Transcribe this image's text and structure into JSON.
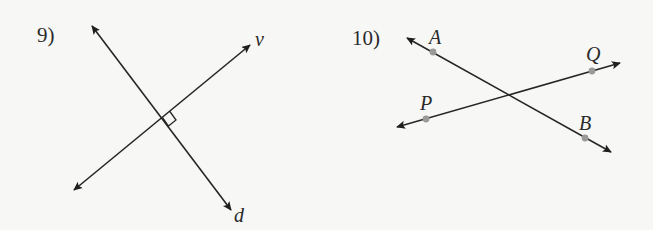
{
  "problems": [
    {
      "number": "9)",
      "lines": [
        {
          "name": "v",
          "label": "v",
          "from": [
            74,
            190
          ],
          "to": [
            250,
            45
          ]
        },
        {
          "name": "d",
          "label": "d",
          "from": [
            92,
            26
          ],
          "to": [
            231,
            210
          ]
        }
      ],
      "right_angle_at": [
        162,
        117
      ],
      "labels": {
        "v": "v",
        "d": "d"
      }
    },
    {
      "number": "10)",
      "lines": [
        {
          "name": "AB",
          "from": [
            407,
            38
          ],
          "to": [
            611,
            152
          ]
        },
        {
          "name": "PQ",
          "from": [
            397,
            127
          ],
          "to": [
            620,
            63
          ]
        }
      ],
      "points": [
        {
          "label": "A",
          "x": 433,
          "y": 52
        },
        {
          "label": "B",
          "x": 585,
          "y": 138
        },
        {
          "label": "P",
          "x": 426,
          "y": 119
        },
        {
          "label": "Q",
          "x": 592,
          "y": 71
        }
      ],
      "labels": {
        "A": "A",
        "B": "B",
        "P": "P",
        "Q": "Q"
      }
    }
  ],
  "colors": {
    "line": "#262626",
    "point": "#9a9a9a",
    "background": "#f7f7f5"
  }
}
